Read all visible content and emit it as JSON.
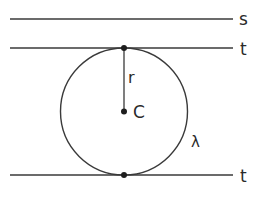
{
  "diagram": {
    "type": "geometry",
    "colors": {
      "stroke": "#3a3a3a",
      "text": "#2a2a2a",
      "background": "#ffffff"
    },
    "lines": [
      {
        "id": "s",
        "label": "s",
        "y": 19
      },
      {
        "id": "t-top",
        "label": "t",
        "y": 48
      },
      {
        "id": "t-bottom",
        "label": "t",
        "y": 175
      }
    ],
    "circle": {
      "label": "λ",
      "cx": 124,
      "cy": 111.5,
      "r": 63.5
    },
    "center": {
      "label": "C"
    },
    "radius": {
      "label": "r"
    },
    "points": [
      {
        "name": "tangent-point-top",
        "x": 124,
        "y": 48
      },
      {
        "name": "center-C",
        "x": 124,
        "y": 111.5
      },
      {
        "name": "tangent-point-bottom",
        "x": 124,
        "y": 175
      }
    ]
  }
}
